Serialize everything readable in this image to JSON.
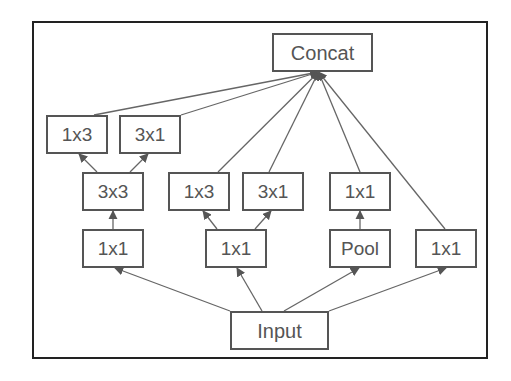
{
  "diagram": {
    "type": "inception-module",
    "colors": {
      "border": "#555555",
      "frame": "#222222",
      "text": "#555555",
      "edge": "#555555"
    },
    "nodes": [
      {
        "id": "concat",
        "label": "Concat",
        "x": 272,
        "y": 33,
        "w": 101,
        "h": 39
      },
      {
        "id": "b1_1x3",
        "label": "1x3",
        "x": 46,
        "y": 115,
        "w": 62,
        "h": 39
      },
      {
        "id": "b1_3x1",
        "label": "3x1",
        "x": 119,
        "y": 115,
        "w": 62,
        "h": 39
      },
      {
        "id": "b1_3x3",
        "label": "3x3",
        "x": 82,
        "y": 172,
        "w": 62,
        "h": 39
      },
      {
        "id": "b1_1x1",
        "label": "1x1",
        "x": 82,
        "y": 229,
        "w": 62,
        "h": 39
      },
      {
        "id": "b2_1x3",
        "label": "1x3",
        "x": 168,
        "y": 172,
        "w": 62,
        "h": 39
      },
      {
        "id": "b2_3x1",
        "label": "3x1",
        "x": 242,
        "y": 172,
        "w": 62,
        "h": 39
      },
      {
        "id": "b2_1x1",
        "label": "1x1",
        "x": 205,
        "y": 229,
        "w": 62,
        "h": 39
      },
      {
        "id": "b3_1x1",
        "label": "1x1",
        "x": 329,
        "y": 172,
        "w": 62,
        "h": 39
      },
      {
        "id": "b3_pool",
        "label": "Pool",
        "x": 329,
        "y": 229,
        "w": 62,
        "h": 39
      },
      {
        "id": "b4_1x1",
        "label": "1x1",
        "x": 415,
        "y": 229,
        "w": 62,
        "h": 39
      },
      {
        "id": "input",
        "label": "Input",
        "x": 230,
        "y": 311,
        "w": 99,
        "h": 39
      }
    ],
    "edges": [
      {
        "from": "input",
        "to": "b1_1x1"
      },
      {
        "from": "input",
        "to": "b2_1x1"
      },
      {
        "from": "input",
        "to": "b3_pool"
      },
      {
        "from": "input",
        "to": "b4_1x1"
      },
      {
        "from": "b1_1x1",
        "to": "b1_3x3"
      },
      {
        "from": "b1_3x3",
        "to": "b1_1x3"
      },
      {
        "from": "b1_3x3",
        "to": "b1_3x1"
      },
      {
        "from": "b2_1x1",
        "to": "b2_1x3"
      },
      {
        "from": "b2_1x1",
        "to": "b2_3x1"
      },
      {
        "from": "b3_pool",
        "to": "b3_1x1"
      },
      {
        "from": "b1_1x3",
        "to": "concat"
      },
      {
        "from": "b1_3x1",
        "to": "concat"
      },
      {
        "from": "b2_1x3",
        "to": "concat"
      },
      {
        "from": "b2_3x1",
        "to": "concat"
      },
      {
        "from": "b3_1x1",
        "to": "concat"
      },
      {
        "from": "b4_1x1",
        "to": "concat"
      }
    ]
  }
}
